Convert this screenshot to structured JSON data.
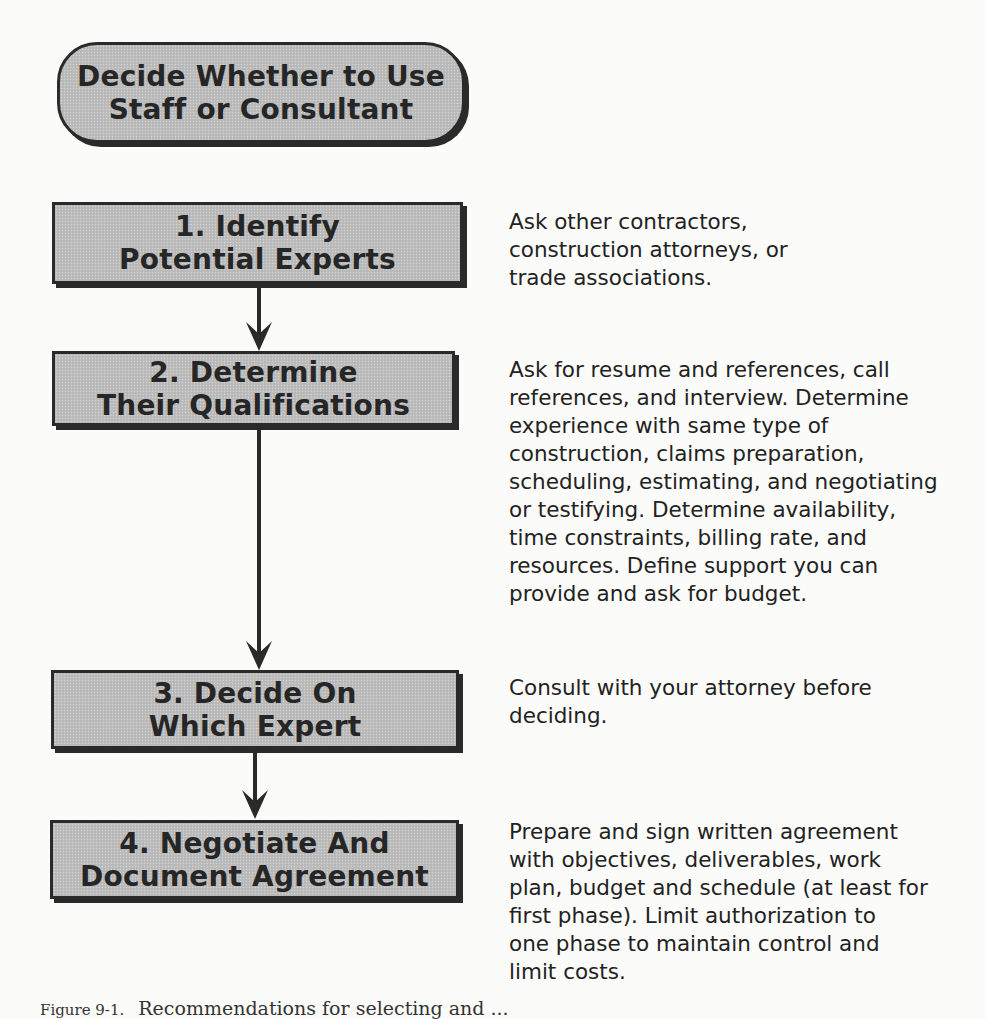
{
  "diagram": {
    "type": "flowchart",
    "start": {
      "lines": [
        "Decide Whether to Use",
        "Staff or Consultant"
      ]
    },
    "steps": [
      {
        "number": "1.",
        "lines": [
          "1. Identify",
          "Potential Experts"
        ],
        "note": "Ask other contractors,\nconstruction attorneys, or\ntrade associations."
      },
      {
        "number": "2.",
        "lines": [
          "2. Determine",
          "Their Qualifications"
        ],
        "note": "Ask for resume and references, call\nreferences, and interview.  Determine\nexperience with same type of\nconstruction, claims preparation,\nscheduling, estimating, and negotiating\nor testifying.  Determine availability,\ntime constraints, billing rate, and\nresources.  Define support you can\nprovide and ask for budget."
      },
      {
        "number": "3.",
        "lines": [
          "3. Decide On",
          "Which Expert"
        ],
        "note": "Consult with your attorney before\ndeciding."
      },
      {
        "number": "4.",
        "lines": [
          "4. Negotiate And",
          "Document Agreement"
        ],
        "note": "Prepare and sign written agreement\nwith objectives, deliverables, work\nplan, budget and schedule (at least for\nfirst phase).  Limit authorization to\none phase to maintain control and\nlimit costs."
      }
    ],
    "connectors": [
      {
        "from": "step-1",
        "to": "step-2"
      },
      {
        "from": "step-2",
        "to": "step-3"
      },
      {
        "from": "step-3",
        "to": "step-4"
      }
    ],
    "colors": {
      "box_fill": "#bdbdbd",
      "box_border": "#2a2a2a",
      "text": "#262626",
      "background": "#fbfbf9"
    }
  },
  "caption": {
    "figure_label": "Figure 9-1.",
    "text": "Recommendations for selecting and ..."
  }
}
